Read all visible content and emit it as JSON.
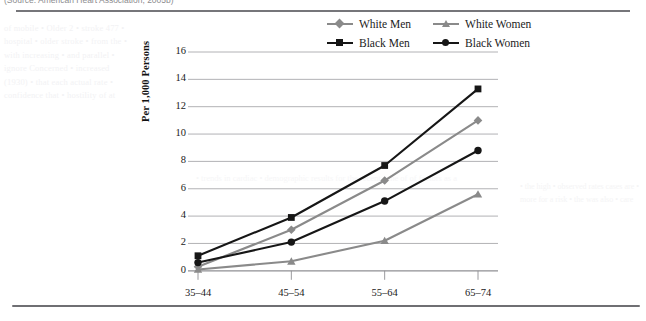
{
  "caption": "(Source: American Heart Association, 2005b)",
  "legend": {
    "position": "top-center",
    "items": [
      {
        "label": "White Men",
        "color": "#8a8a8a",
        "marker": "diamond"
      },
      {
        "label": "White Women",
        "color": "#8a8a8a",
        "marker": "triangle"
      },
      {
        "label": "Black Men",
        "color": "#161616",
        "marker": "square"
      },
      {
        "label": "Black Women",
        "color": "#161616",
        "marker": "circle"
      }
    ]
  },
  "axes": {
    "ylabel": "Per 1,000 Persons",
    "yticks": [
      "0",
      "2",
      "4",
      "6",
      "8",
      "10",
      "12",
      "14",
      "16"
    ],
    "xticks": [
      "35–44",
      "45–54",
      "55–64",
      "65–74"
    ]
  },
  "chart_data": {
    "type": "line",
    "title": "",
    "xlabel": "",
    "ylabel": "Per 1,000 Persons",
    "categories": [
      "35–44",
      "45–54",
      "55–64",
      "65–74"
    ],
    "ylim": [
      0,
      16
    ],
    "ytick_step": 2,
    "grid": true,
    "legend_position": "top-center",
    "series": [
      {
        "name": "White Men",
        "color": "#8a8a8a",
        "marker": "diamond",
        "values": [
          0.3,
          3.0,
          6.6,
          11.0
        ]
      },
      {
        "name": "White Women",
        "color": "#8a8a8a",
        "marker": "triangle",
        "values": [
          0.1,
          0.7,
          2.2,
          5.6
        ]
      },
      {
        "name": "Black Men",
        "color": "#161616",
        "marker": "square",
        "values": [
          1.1,
          3.9,
          7.7,
          13.3
        ]
      },
      {
        "name": "Black Women",
        "color": "#161616",
        "marker": "circle",
        "values": [
          0.6,
          2.1,
          5.1,
          8.8
        ]
      }
    ]
  },
  "bleed_text": {
    "left": "of mobile • Older 2 • stroke 477 • hospital • older stroke • from the • with increasing • and parallel • ignore Concerned • increased (1930) • that each actual rate • confidence that • hostility of at",
    "mid": "• trends in cardiac • demographic results for the recent • the of of factors as a",
    "right": "• the high • observed rates cases are • more for a risk • the was also • care"
  }
}
